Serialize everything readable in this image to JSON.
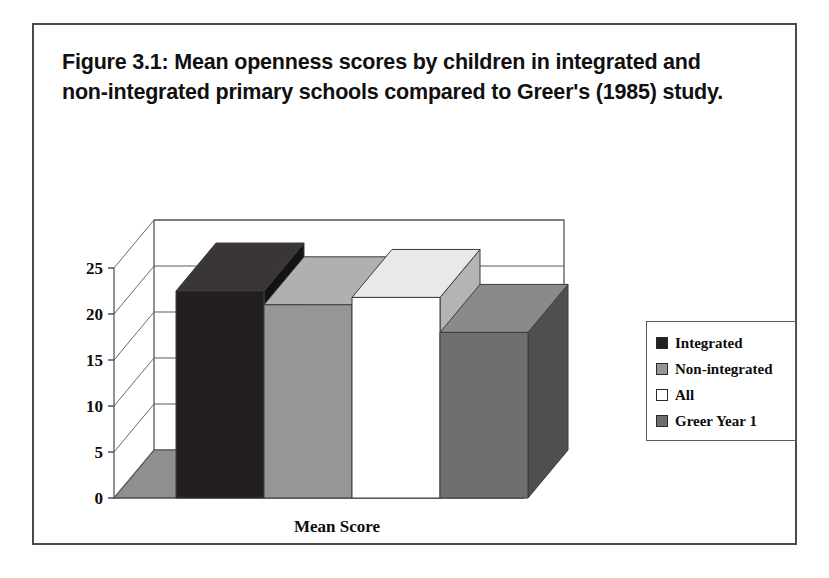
{
  "figure": {
    "title": "Figure 3.1: Mean openness scores by children in integrated and non-integrated primary schools compared to Greer's (1985) study.",
    "frame_border_color": "#4a4a4a",
    "background_color": "#ffffff"
  },
  "legend": {
    "position": "right",
    "items": [
      {
        "label": "Integrated",
        "color": "#231f20"
      },
      {
        "label": "Non-integrated",
        "color": "#969696"
      },
      {
        "label": "All",
        "color": "#ffffff"
      },
      {
        "label": "Greer Year 1",
        "color": "#6e6e6e"
      }
    ]
  },
  "chart_data": {
    "type": "bar",
    "title": "Figure 3.1: Mean openness scores by children in integrated and non-integrated primary schools compared to Greer's (1985) study.",
    "render_style": "3d-column",
    "categories": [
      "Mean Score"
    ],
    "xlabel": "Mean Score",
    "ylabel": "",
    "ylim": [
      0,
      25
    ],
    "yticks": [
      0,
      5,
      10,
      15,
      20,
      25
    ],
    "ytick_labels": [
      "0",
      "5",
      "10",
      "15",
      "20",
      "25"
    ],
    "grid": true,
    "legend_position": "right",
    "series": [
      {
        "name": "Integrated",
        "values": [
          22.5
        ],
        "color": "#231f20"
      },
      {
        "name": "Non-integrated",
        "values": [
          21.0
        ],
        "color": "#969696"
      },
      {
        "name": "All",
        "values": [
          21.8
        ],
        "color": "#ffffff"
      },
      {
        "name": "Greer Year 1",
        "values": [
          18.0
        ],
        "color": "#6e6e6e"
      }
    ]
  }
}
